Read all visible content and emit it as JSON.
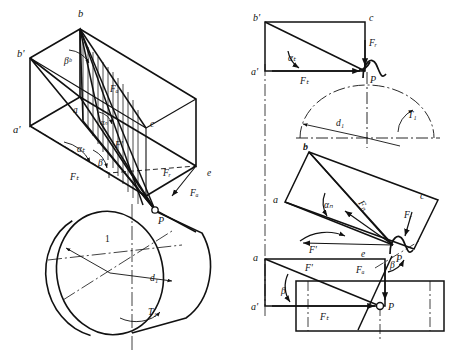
{
  "figure": {
    "background_color": "#ffffff",
    "line_color": "#111111",
    "width": 454,
    "height": 358
  },
  "isometric_view": {
    "name": "isometric-force-box",
    "vertices": {
      "b": "b",
      "b_prime": "b'",
      "a": "a",
      "a_prime": "a'",
      "c": "c",
      "e": "e"
    },
    "angles": {
      "beta_b": "βᵇ",
      "alpha_n": "αₙ",
      "alpha_t": "αₜ",
      "beta": "β"
    },
    "forces": {
      "Fa": "Fₐ",
      "Ft": "Fₜ",
      "Fr": "Fᵣ",
      "Fn": "Fₙ",
      "F_prime": "F'"
    },
    "point": "P"
  },
  "cylinder_view": {
    "name": "gear-cylinder",
    "part_number": "1",
    "diameter_label": "d₁",
    "torque_label": "T₁",
    "point": "P",
    "force": "Fₐ"
  },
  "projection_top": {
    "name": "front-projection-view",
    "vertices": {
      "b_prime": "b'",
      "c": "c",
      "a_prime": "a'"
    },
    "angle": "αₜ",
    "forces": {
      "Ft": "Fₜ",
      "Fr": "Fᵣ"
    },
    "point": "P",
    "diameter_label": "d₁",
    "torque_label": "T₁",
    "bottom_vertex": "b"
  },
  "projection_middle": {
    "name": "rotated-plane-view",
    "vertices": {
      "b": "b",
      "a": "a",
      "c": "c"
    },
    "angle": "αₙ",
    "forces": {
      "Fn": "Fₙ",
      "Fr": "Fᵣ",
      "F_prime": "F'"
    },
    "point": "P"
  },
  "projection_bottom": {
    "name": "top-projection-view",
    "vertices": {
      "a": "a",
      "a_prime": "a'",
      "e": "e"
    },
    "angles": {
      "beta_left": "β",
      "beta_right": "β"
    },
    "forces": {
      "F_prime": "F'",
      "Fa": "Fₐ",
      "Ft": "Fₜ"
    },
    "point": "P"
  }
}
